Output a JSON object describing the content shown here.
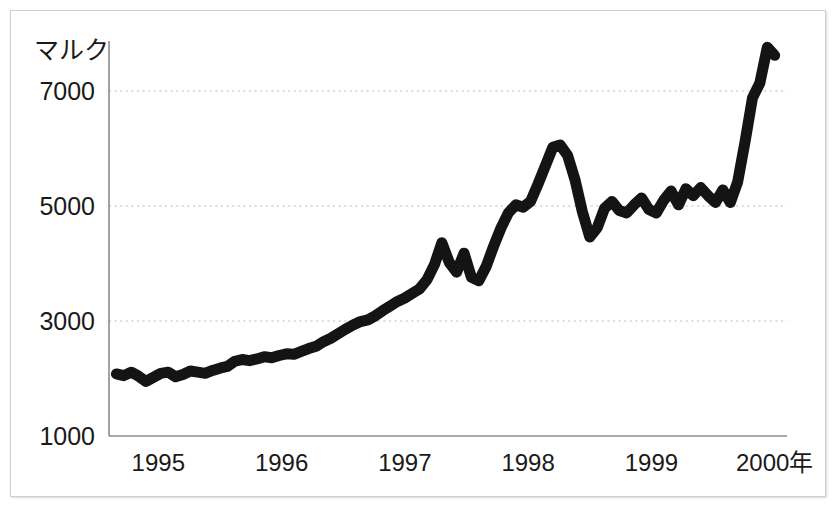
{
  "chart_data": {
    "type": "line",
    "title": "",
    "subtitle": "",
    "xlabel": "",
    "ylabel": "マルク",
    "unit_label": "マルク",
    "grid": true,
    "legend": false,
    "legend_position": "none",
    "line_color": "#141414",
    "grid_color": "#b9b9b9",
    "axis_color": "#8c8c8c",
    "xlim": [
      1994.6,
      2000.1
    ],
    "ylim": [
      1000,
      8000
    ],
    "ytick_labels": [
      "7000",
      "5000",
      "3000",
      "1000"
    ],
    "ytick_values": [
      7000,
      5000,
      3000,
      1000
    ],
    "xtick_labels": [
      "1995",
      "1996",
      "1997",
      "1998",
      "1999",
      "2000年"
    ],
    "xtick_values": [
      1995,
      1996,
      1997,
      1998,
      1999,
      2000
    ],
    "series": [
      {
        "name": "マルク",
        "x": [
          1994.66,
          1994.72,
          1994.78,
          1994.84,
          1994.9,
          1994.96,
          1995.02,
          1995.08,
          1995.14,
          1995.2,
          1995.26,
          1995.32,
          1995.38,
          1995.44,
          1995.5,
          1995.56,
          1995.62,
          1995.68,
          1995.74,
          1995.8,
          1995.86,
          1995.92,
          1995.98,
          1996.04,
          1996.1,
          1996.16,
          1996.22,
          1996.28,
          1996.34,
          1996.4,
          1996.46,
          1996.52,
          1996.58,
          1996.64,
          1996.7,
          1996.76,
          1996.82,
          1996.88,
          1996.94,
          1997.0,
          1997.06,
          1997.12,
          1997.18,
          1997.24,
          1997.3,
          1997.36,
          1997.42,
          1997.48,
          1997.54,
          1997.6,
          1997.66,
          1997.72,
          1997.78,
          1997.84,
          1997.9,
          1997.96,
          1998.02,
          1998.08,
          1998.14,
          1998.2,
          1998.26,
          1998.32,
          1998.38,
          1998.44,
          1998.5,
          1998.56,
          1998.62,
          1998.68,
          1998.74,
          1998.8,
          1998.86,
          1998.92,
          1998.98,
          1999.04,
          1999.1,
          1999.16,
          1999.22,
          1999.28,
          1999.34,
          1999.4,
          1999.46,
          1999.52,
          1999.58,
          1999.64,
          1999.7,
          1999.76,
          1999.82,
          1999.88,
          1999.94,
          2000.0
        ],
        "values": [
          2080,
          2050,
          2110,
          2040,
          1950,
          2020,
          2090,
          2110,
          2030,
          2070,
          2130,
          2110,
          2090,
          2140,
          2180,
          2210,
          2300,
          2330,
          2310,
          2340,
          2380,
          2360,
          2400,
          2430,
          2420,
          2470,
          2520,
          2560,
          2640,
          2700,
          2780,
          2860,
          2930,
          2990,
          3020,
          3090,
          3180,
          3260,
          3340,
          3400,
          3480,
          3560,
          3720,
          3980,
          4360,
          4020,
          3850,
          4180,
          3760,
          3700,
          3950,
          4300,
          4620,
          4880,
          5020,
          4980,
          5080,
          5380,
          5700,
          6020,
          6060,
          5880,
          5460,
          4900,
          4460,
          4620,
          4960,
          5080,
          4920,
          4880,
          5020,
          5140,
          4940,
          4880,
          5100,
          5260,
          5020,
          5300,
          5180,
          5320,
          5180,
          5060,
          5280,
          5060,
          5420,
          6120,
          6880,
          7140,
          7760,
          7620
        ],
        "color": "#141414"
      }
    ],
    "annotations": []
  },
  "figure": {
    "background": "#ffffff",
    "border_color": "#cfcfcf"
  }
}
